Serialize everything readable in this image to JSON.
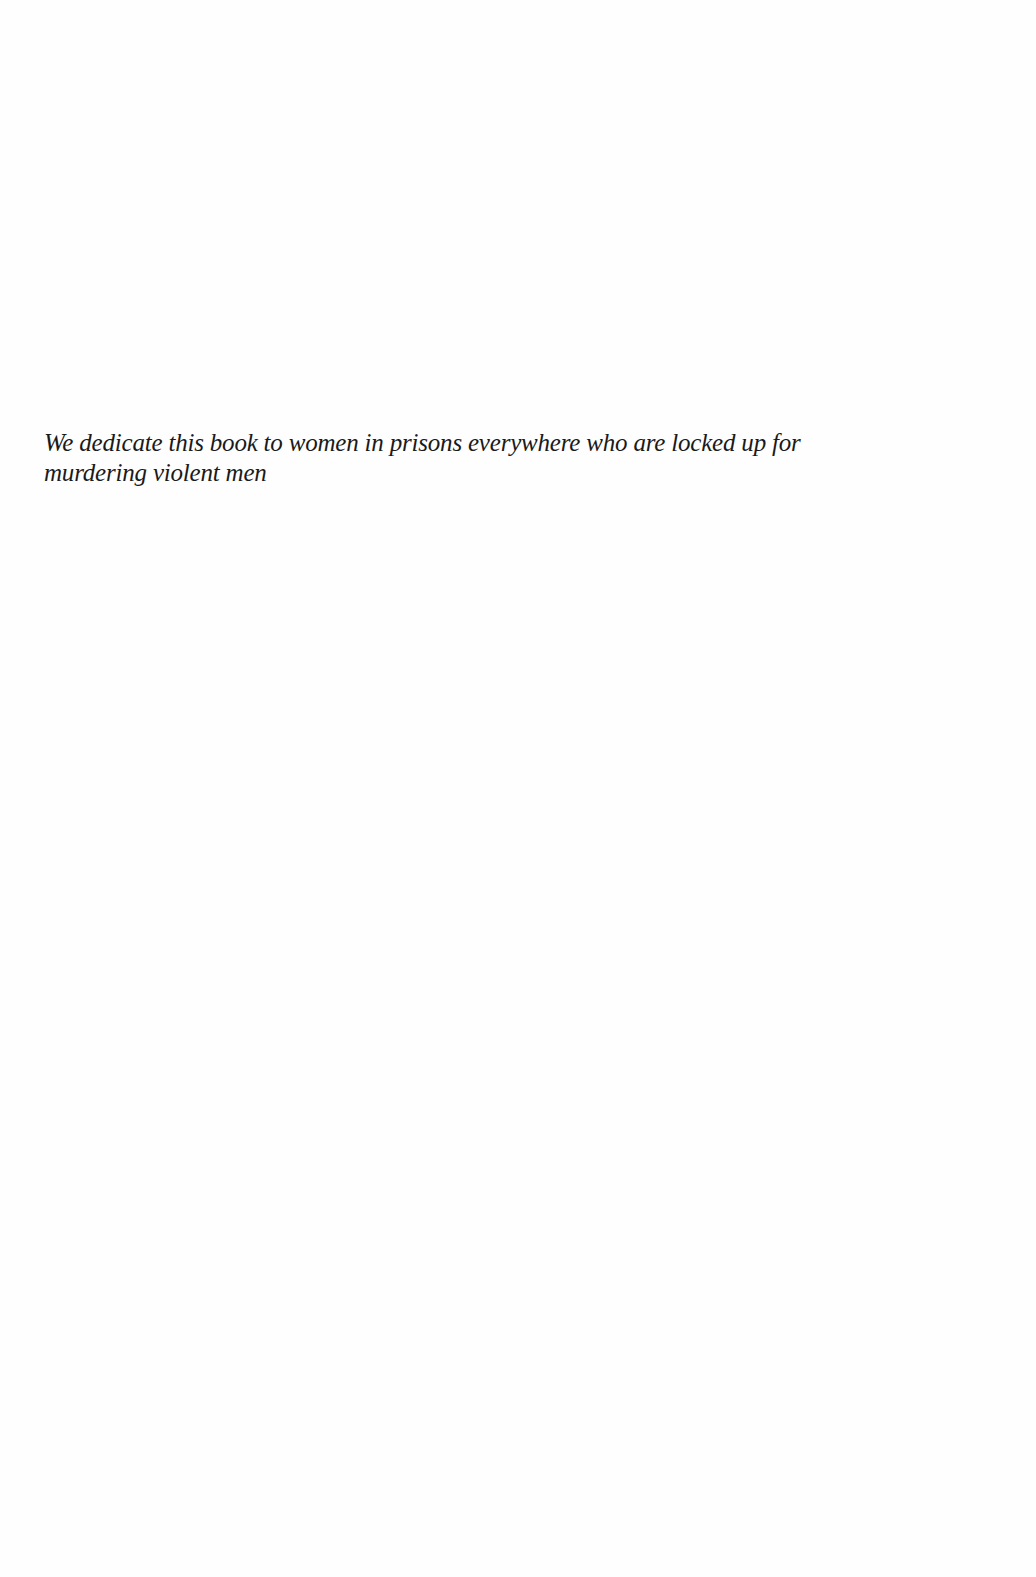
{
  "page": {
    "background": "#fefefe",
    "text_color": "#1a1a1a"
  },
  "dedication": {
    "lines": [
      "We dedicate this book to women in prisons everywhere who are locked up for",
      "murdering violent men"
    ]
  }
}
